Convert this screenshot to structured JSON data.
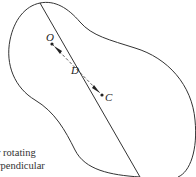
{
  "diagram": {
    "points": {
      "O": {
        "label": "O",
        "x": 51,
        "y": 44
      },
      "D": {
        "label": "D",
        "x": 76,
        "y": 70
      },
      "C": {
        "label": "C",
        "x": 106,
        "y": 98
      }
    },
    "caption_lines": [
      "r rotating",
      "rpendicular"
    ],
    "stroke_color": "#333333"
  }
}
